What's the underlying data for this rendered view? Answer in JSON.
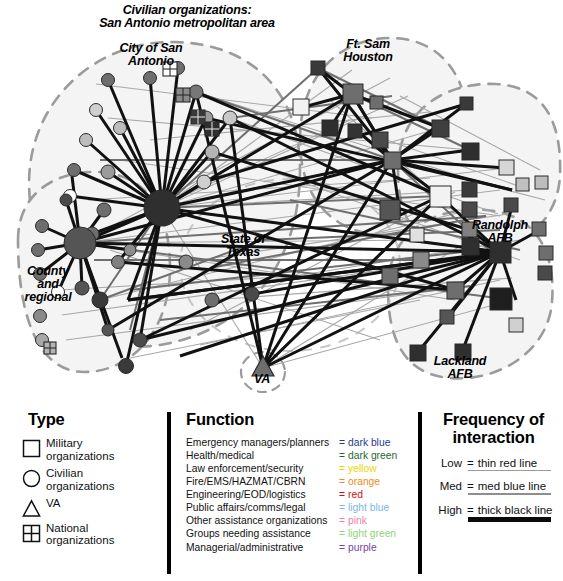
{
  "diagram": {
    "title": "Civilian organizations:\nSan Antonio metropolitan area",
    "clusters": [
      {
        "id": "city-of-san-antonio",
        "label": "City of San\nAntonio"
      },
      {
        "id": "ft-sam-houston",
        "label": "Ft. Sam\nHouston"
      },
      {
        "id": "randolph-afb",
        "label": "Randolph\nAFB"
      },
      {
        "id": "lackland-afb",
        "label": "Lackland\nAFB"
      },
      {
        "id": "state-of-texas",
        "label": "State of\nTexas"
      },
      {
        "id": "va",
        "label": "VA"
      },
      {
        "id": "county-and-regional",
        "label": "County\nand\nregional"
      }
    ]
  },
  "legend": {
    "type": {
      "heading": "Type",
      "items": [
        {
          "icon": "square-icon",
          "label": "Military\norganizations"
        },
        {
          "icon": "circle-icon",
          "label": "Civilian\norganizations"
        },
        {
          "icon": "triangle-icon",
          "label": "VA"
        },
        {
          "icon": "grid-square-icon",
          "label": "National\norganizations"
        }
      ]
    },
    "function": {
      "heading": "Function",
      "equals": "=",
      "items": [
        {
          "name": "Emergency managers/planners",
          "color_name": "dark blue",
          "color": "#1f3a93"
        },
        {
          "name": "Health/medical",
          "color_name": "dark green",
          "color": "#1d6b2a"
        },
        {
          "name": "Law enforcement/security",
          "color_name": "yellow",
          "color": "#e8d600"
        },
        {
          "name": "Fire/EMS/HAZMAT/CBRN",
          "color_name": "orange",
          "color": "#f08a1c"
        },
        {
          "name": "Engineering/EOD/logistics",
          "color_name": "red",
          "color": "#cc1111"
        },
        {
          "name": "Public affairs/comms/legal",
          "color_name": "light blue",
          "color": "#79b7e8"
        },
        {
          "name": "Other assistance organizations",
          "color_name": "pink",
          "color": "#ef7fa8"
        },
        {
          "name": "Groups needing assistance",
          "color_name": "light green",
          "color": "#93d17a"
        },
        {
          "name": "Managerial/administrative",
          "color_name": "purple",
          "color": "#7b3fa0"
        }
      ]
    },
    "frequency": {
      "heading": "Frequency of\ninteraction",
      "equals": "=",
      "items": [
        {
          "level": "Low",
          "description": "thin red line",
          "weight": "low"
        },
        {
          "level": "Med",
          "description": "med blue line",
          "weight": "med"
        },
        {
          "level": "High",
          "description": "thick black line",
          "weight": "high"
        }
      ]
    }
  }
}
